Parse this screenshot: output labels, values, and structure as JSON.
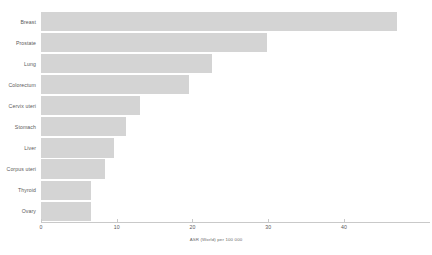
{
  "chart_data": {
    "type": "bar",
    "orientation": "horizontal",
    "title": "",
    "xlabel": "ASR (World) per 100 000",
    "ylabel": "",
    "categories": [
      "Breast",
      "Prostate",
      "Lung",
      "Colorectum",
      "Cervix uteri",
      "Stomach",
      "Liver",
      "Corpus uteri",
      "Thyroid",
      "Ovary"
    ],
    "values": [
      47.0,
      29.9,
      22.6,
      19.6,
      13.1,
      11.2,
      9.6,
      8.5,
      6.6,
      6.6
    ],
    "xlim": [
      0,
      50.7
    ],
    "xticks": [
      0,
      10,
      20,
      30,
      40
    ],
    "xtick_labels": [
      "0",
      "10",
      "20",
      "30",
      "40"
    ],
    "grid": false,
    "legend": "none",
    "bar_color": "#d4d4d4",
    "background_color": "#ffffff",
    "axis_color": "#c9c9c9",
    "text_color": "#5a5a5a"
  }
}
